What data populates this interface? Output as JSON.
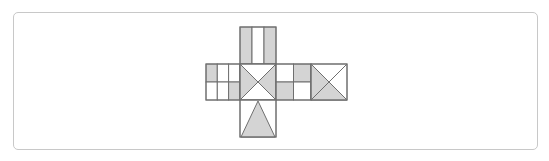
{
  "figure": {
    "colors": {
      "shade": "#d4d4d4",
      "stroke": "#6f6f6f",
      "background": "#ffffff",
      "frame": "#c8c8c8"
    },
    "faces": [
      {
        "id": "top",
        "pattern": "three vertical strips",
        "shaded": [
          "left strip",
          "right strip"
        ]
      },
      {
        "id": "left",
        "pattern": "3x2 grid",
        "shaded": [
          "top-left cell",
          "bottom-right cell"
        ]
      },
      {
        "id": "center",
        "pattern": "X diagonals",
        "shaded": [
          "left triangle",
          "right triangle"
        ]
      },
      {
        "id": "center-right",
        "pattern": "2x2 grid",
        "shaded": [
          "top-right cell",
          "bottom-left cell"
        ]
      },
      {
        "id": "far-right",
        "pattern": "X diagonals",
        "shaded": [
          "left triangle",
          "bottom triangle"
        ]
      },
      {
        "id": "bottom",
        "pattern": "isosceles triangle",
        "shaded": [
          "triangle"
        ]
      }
    ]
  }
}
